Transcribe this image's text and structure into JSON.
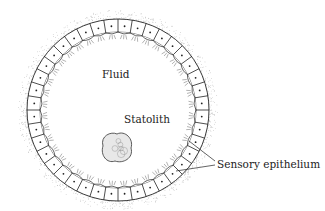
{
  "labels": {
    "fluid": "Fluid",
    "statolith": "Statolith",
    "sensory_epithelium": "Sensory epithelium"
  },
  "geometry": {
    "center": [
      118,
      110
    ],
    "outer_radius": 91,
    "inner_radius": 78,
    "cell_count": 40,
    "statolith_center": [
      117,
      148
    ]
  },
  "colors": {
    "line": "#222222",
    "stipple": "#999999"
  }
}
